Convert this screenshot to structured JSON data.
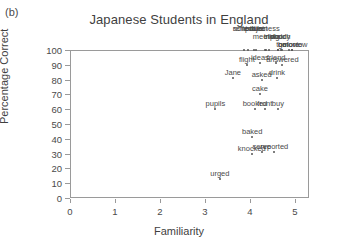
{
  "panel": {
    "label": "(b)"
  },
  "chart_data": {
    "type": "scatter",
    "title": "Japanese Students in England",
    "xlabel": "Familiarity",
    "ylabel": "Percentage Correct",
    "xlim": [
      0,
      5
    ],
    "ylim": [
      0,
      100
    ],
    "xticks": [
      0,
      1,
      2,
      3,
      4,
      5
    ],
    "yticks": [
      0,
      10,
      20,
      30,
      40,
      50,
      60,
      70,
      80,
      90,
      100
    ],
    "grid": false,
    "legend": null,
    "points": [
      {
        "label": "nobody",
        "x": 4.62,
        "y": 100
      },
      {
        "label": "lecture",
        "x": 4.08,
        "y": 100
      },
      {
        "label": "meeting",
        "x": 4.36,
        "y": 100
      },
      {
        "label": "go",
        "x": 4.72,
        "y": 100
      },
      {
        "label": "tomorrow",
        "x": 4.93,
        "y": 100
      },
      {
        "label": "schedule",
        "x": 3.96,
        "y": 100
      },
      {
        "label": "business",
        "x": 4.33,
        "y": 100
      },
      {
        "label": "watch",
        "x": 4.68,
        "y": 100
      },
      {
        "label": "movie",
        "x": 4.94,
        "y": 100
      },
      {
        "label": "remind",
        "x": 3.87,
        "y": 100
      },
      {
        "label": "project",
        "x": 4.14,
        "y": 100
      },
      {
        "label": "trip",
        "x": 4.42,
        "y": 100
      },
      {
        "label": "door",
        "x": 4.62,
        "y": 100
      },
      {
        "label": "before",
        "x": 4.86,
        "y": 100
      },
      {
        "label": "ideas",
        "x": 4.22,
        "y": 91
      },
      {
        "label": "friend",
        "x": 4.58,
        "y": 91
      },
      {
        "label": "flight",
        "x": 3.93,
        "y": 90
      },
      {
        "label": "answered",
        "x": 4.72,
        "y": 90
      },
      {
        "label": "Jane",
        "x": 3.62,
        "y": 81
      },
      {
        "label": "drink",
        "x": 4.6,
        "y": 81
      },
      {
        "label": "asked",
        "x": 4.26,
        "y": 80
      },
      {
        "label": "cake",
        "x": 4.22,
        "y": 70
      },
      {
        "label": "pupils",
        "x": 3.23,
        "y": 60
      },
      {
        "label": "front",
        "x": 4.33,
        "y": 60
      },
      {
        "label": "buy",
        "x": 4.62,
        "y": 60
      },
      {
        "label": "booked",
        "x": 4.11,
        "y": 60
      },
      {
        "label": "baked",
        "x": 4.05,
        "y": 41
      },
      {
        "label": "serve",
        "x": 4.26,
        "y": 31
      },
      {
        "label": "reported",
        "x": 4.54,
        "y": 31
      },
      {
        "label": "knocked",
        "x": 4.04,
        "y": 30
      },
      {
        "label": "urged",
        "x": 3.33,
        "y": 13
      }
    ]
  }
}
